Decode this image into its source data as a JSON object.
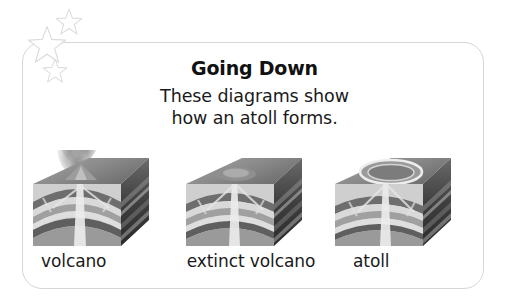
{
  "card": {
    "title": "Going Down",
    "subtitle_line_1": "These diagrams show",
    "subtitle_line_2": "how an atoll forms."
  },
  "decorations": {
    "stars": [
      {
        "name": "star-large",
        "size": "large"
      },
      {
        "name": "star-medium",
        "size": "medium"
      },
      {
        "name": "star-small",
        "size": "small"
      }
    ]
  },
  "diagrams": [
    {
      "id": "volcano",
      "label": "volcano",
      "has_plume": true,
      "has_atoll_ring": false,
      "description": "Cutaway block diagram of an active volcano with an ash plume rising from the summit and a central magma conduit through folded rock strata."
    },
    {
      "id": "extinct-volcano",
      "label": "extinct volcano",
      "has_plume": false,
      "has_atoll_ring": false,
      "description": "Cutaway block diagram of an extinct volcano, the summit eroded flat, with the solidified conduit still visible through the folded strata."
    },
    {
      "id": "atoll",
      "label": "atoll",
      "has_plume": false,
      "has_atoll_ring": true,
      "description": "Cutaway block diagram of an atoll, a ring-shaped reef surrounding a central lagoon above the subsided volcano."
    }
  ],
  "colors": {
    "frame_border": "#d6d6d6",
    "star_outline": "#dcdcdc",
    "text": "#1a1a1a",
    "title_text": "#111111",
    "background": "#ffffff",
    "block_top_face": "#8d8d8d",
    "block_side_face": "#4a4a4a",
    "strata_light": "#d8d8d8",
    "strata_mid": "#a8a8a8",
    "strata_dark": "#6b6b6b",
    "conduit": "#e8e8e8",
    "plume": "#9a9a9a"
  }
}
